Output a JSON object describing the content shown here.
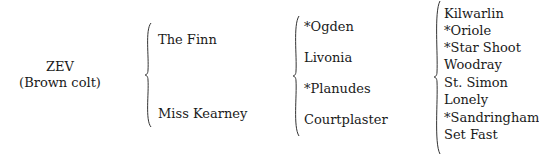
{
  "subject": {
    "name": "ZEV",
    "description": "(Brown colt)"
  },
  "parents": [
    {
      "name": "The Finn"
    },
    {
      "name": "Miss Kearney"
    }
  ],
  "grandparents": [
    {
      "name": "*Ogden"
    },
    {
      "name": "Livonia"
    },
    {
      "name": "*Planudes"
    },
    {
      "name": "Courtplaster"
    }
  ],
  "great_grandparents": [
    {
      "name": "Kilwarlin"
    },
    {
      "name": "*Oriole"
    },
    {
      "name": "*Star Shoot"
    },
    {
      "name": "Woodray"
    },
    {
      "name": "St. Simon"
    },
    {
      "name": "Lonely"
    },
    {
      "name": "*Sandringham"
    },
    {
      "name": "Set Fast"
    }
  ]
}
